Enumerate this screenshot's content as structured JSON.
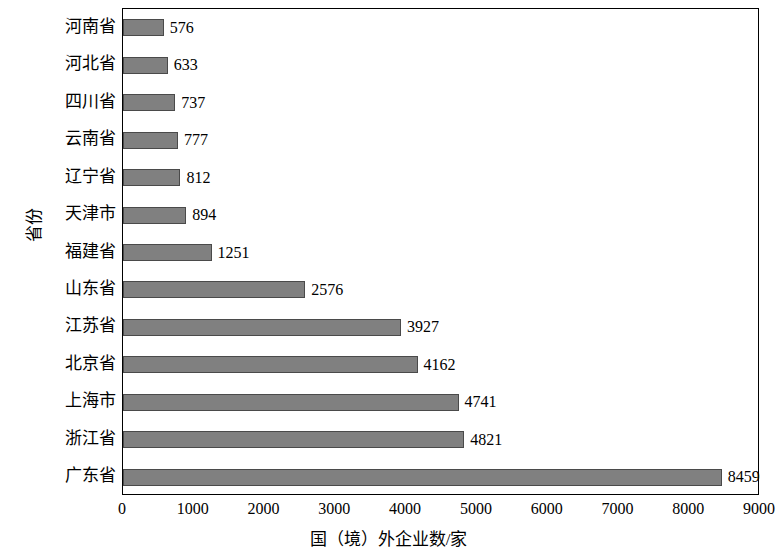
{
  "chart_data": {
    "type": "bar",
    "orientation": "horizontal",
    "title": "",
    "xlabel": "国（境）外企业数/家",
    "ylabel": "省份",
    "xlim": [
      0,
      9000
    ],
    "xticks": [
      0,
      1000,
      2000,
      3000,
      4000,
      5000,
      6000,
      7000,
      8000,
      9000
    ],
    "grid": false,
    "legend": null,
    "bar_color": "#808080",
    "bar_border_color": "#4a4a4a",
    "categories": [
      "河南省",
      "河北省",
      "四川省",
      "云南省",
      "辽宁省",
      "天津市",
      "福建省",
      "山东省",
      "江苏省",
      "北京省",
      "上海市",
      "浙江省",
      "广东省"
    ],
    "values": [
      576,
      633,
      737,
      777,
      812,
      894,
      1251,
      2576,
      3927,
      4162,
      4741,
      4821,
      8459
    ],
    "value_labels": [
      "576",
      "633",
      "737",
      "777",
      "812",
      "894",
      "1251",
      "2576",
      "3927",
      "4162",
      "4741",
      "4821",
      "8459"
    ]
  }
}
